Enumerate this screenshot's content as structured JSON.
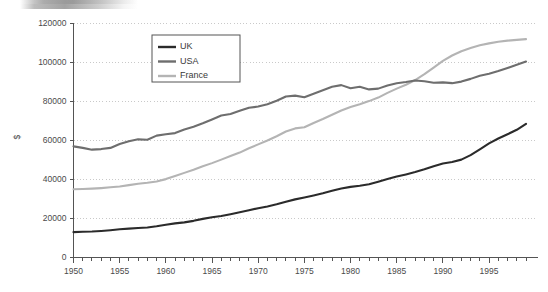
{
  "chart_data": {
    "type": "line",
    "title": "",
    "subtitle": "",
    "xlabel": "",
    "ylabel": "$",
    "xlim": [
      1950,
      1999
    ],
    "ylim": [
      0,
      120000
    ],
    "ytick_step": 20000,
    "xtick_step": 5,
    "x_minor_tick_step": 1,
    "grid": "horizontal-dotted",
    "legend_position": "upper-center-left",
    "x": [
      1950,
      1951,
      1952,
      1953,
      1954,
      1955,
      1956,
      1957,
      1958,
      1959,
      1960,
      1961,
      1962,
      1963,
      1964,
      1965,
      1966,
      1967,
      1968,
      1969,
      1970,
      1971,
      1972,
      1973,
      1974,
      1975,
      1976,
      1977,
      1978,
      1979,
      1980,
      1981,
      1982,
      1983,
      1984,
      1985,
      1986,
      1987,
      1988,
      1989,
      1990,
      1991,
      1992,
      1993,
      1994,
      1995,
      1996,
      1997,
      1998,
      1999
    ],
    "ytick_labels": [
      "0",
      "20000",
      "40000",
      "60000",
      "80000",
      "100000",
      "120000"
    ],
    "xtick_labels": [
      "1950",
      "1955",
      "1960",
      "1965",
      "1970",
      "1975",
      "1980",
      "1985",
      "1990",
      "1995"
    ],
    "series": [
      {
        "name": "UK",
        "color": "#2b2b2b",
        "values": [
          13000,
          13200,
          13300,
          13600,
          14000,
          14500,
          14800,
          15100,
          15400,
          16000,
          16800,
          17500,
          18000,
          18800,
          19800,
          20600,
          21300,
          22200,
          23200,
          24200,
          25300,
          26200,
          27300,
          28600,
          29800,
          30800,
          31800,
          32900,
          34200,
          35400,
          36200,
          36800,
          37600,
          38900,
          40200,
          41500,
          42600,
          43800,
          45200,
          46800,
          48200,
          49000,
          50200,
          52500,
          55500,
          58500,
          61000,
          63200,
          65500,
          68500
        ]
      },
      {
        "name": "USA",
        "color": "#6e6e6e",
        "values": [
          57000,
          56200,
          55300,
          55600,
          56200,
          58200,
          59600,
          60600,
          60400,
          62500,
          63200,
          63800,
          65600,
          67000,
          68800,
          70800,
          72800,
          73600,
          75200,
          76800,
          77400,
          78600,
          80400,
          82600,
          83000,
          82200,
          84000,
          85800,
          87600,
          88400,
          86800,
          87600,
          86200,
          86600,
          88200,
          89400,
          90000,
          90800,
          90400,
          89600,
          89800,
          89400,
          90200,
          91600,
          93200,
          94200,
          95600,
          97200,
          98800,
          100500
        ]
      },
      {
        "name": "France",
        "color": "#b4b4b4",
        "values": [
          35000,
          35100,
          35300,
          35600,
          36000,
          36400,
          37100,
          37800,
          38300,
          39000,
          40200,
          41800,
          43400,
          45000,
          46800,
          48400,
          50200,
          52000,
          53800,
          56000,
          58000,
          60000,
          62200,
          64600,
          66200,
          66800,
          69000,
          71000,
          73200,
          75400,
          77200,
          78600,
          80200,
          82000,
          84400,
          86600,
          88600,
          91000,
          94000,
          97400,
          100800,
          103600,
          105800,
          107400,
          108800,
          109800,
          110600,
          111200,
          111600,
          112000
        ]
      }
    ]
  },
  "legend": {
    "items": [
      {
        "label": "UK"
      },
      {
        "label": "USA"
      },
      {
        "label": "France"
      }
    ]
  },
  "axes": {
    "y_title": "$"
  }
}
